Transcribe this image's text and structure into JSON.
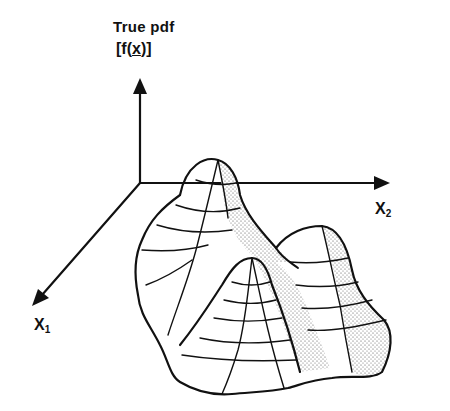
{
  "diagram": {
    "title": "True pdf",
    "function_label": "[f(x)]",
    "function_label_parts": {
      "open": "[",
      "f": "f",
      "arg": "x",
      "close": "]"
    },
    "axes": {
      "vertical": "f(x)",
      "x1": {
        "letter": "X",
        "sub": "1"
      },
      "x2": {
        "letter": "X",
        "sub": "2"
      }
    },
    "surface": {
      "description": "bimodal/multimodal probability density surface with wireframe grid and stippled bands",
      "peaks": 3
    },
    "colors": {
      "ink": "#111111",
      "background": "#ffffff",
      "stipple": "#555555"
    }
  }
}
